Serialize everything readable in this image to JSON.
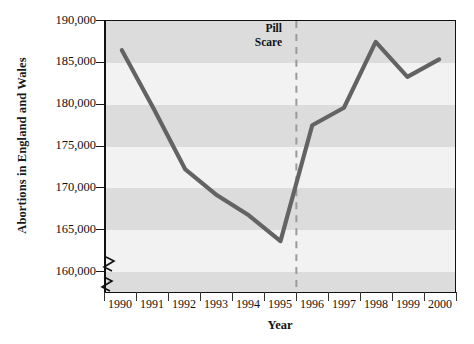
{
  "chart_data": {
    "type": "line",
    "title": "",
    "xlabel": "Year",
    "ylabel": "Abortions in England and Wales",
    "categories": [
      "1990",
      "1991",
      "1992",
      "1993",
      "1994",
      "1995",
      "1996",
      "1997",
      "1998",
      "1999",
      "2000"
    ],
    "x": [
      1990,
      1991,
      1992,
      1993,
      1994,
      1995,
      1996,
      1997,
      1998,
      1999,
      2000
    ],
    "values": [
      186500,
      179500,
      172200,
      169100,
      166700,
      163600,
      177500,
      179600,
      187500,
      183300,
      185400
    ],
    "series": [
      {
        "name": "Abortions in England and Wales",
        "values": [
          186500,
          179500,
          172200,
          169100,
          166700,
          163600,
          177500,
          179600,
          187500,
          183300,
          185400
        ]
      }
    ],
    "ylim": [
      157500,
      190000
    ],
    "yticks": [
      160000,
      165000,
      170000,
      175000,
      180000,
      185000,
      190000
    ],
    "ytick_labels": [
      "160,000",
      "165,000",
      "170,000",
      "175,000",
      "180,000",
      "185,000",
      "190,000"
    ],
    "xlim": [
      1989.5,
      2000.5
    ],
    "grid": "horizontal-bands",
    "axis_break": true,
    "legend": "none",
    "annotations": [
      {
        "name": "pill-scare",
        "text_line1": "Pill",
        "text_line2": "Scare",
        "x": 1995.5,
        "style": "dashed-vertical-line"
      }
    ],
    "colors": {
      "line": "#636363",
      "band_dark": "#dcdcdc",
      "band_light": "#f2f2f2",
      "axis": "#111111",
      "annotation_line": "#9a9a9a",
      "background": "#ffffff"
    }
  }
}
